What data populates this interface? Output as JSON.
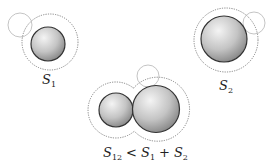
{
  "diagram": {
    "colors": {
      "sphere_light": "#f2f2f2",
      "sphere_dark": "#7a7a7a",
      "sphere_outline": "#333333",
      "dotted_surface": "#777777",
      "probe": "#b0b0b0"
    },
    "labels": {
      "s1": {
        "main": "S",
        "sub": "1"
      },
      "s2": {
        "main": "S",
        "sub": "2"
      },
      "combined": {
        "left_main": "S",
        "left_sub": "12",
        "op1": "<",
        "mid_main": "S",
        "mid_sub": "1",
        "op2": "+",
        "right_main": "S",
        "right_sub": "2"
      }
    }
  }
}
